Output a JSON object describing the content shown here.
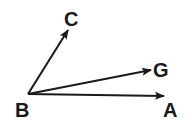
{
  "diagram": {
    "type": "vectors-from-common-point",
    "origin": {
      "label": "B"
    },
    "rays": [
      {
        "label": "C"
      },
      {
        "label": "G"
      },
      {
        "label": "A"
      }
    ],
    "colors": {
      "stroke": "#1a1a1a",
      "background": "#ffffff"
    }
  }
}
